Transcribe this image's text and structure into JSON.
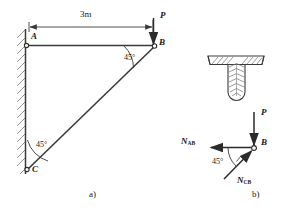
{
  "figure": {
    "caption_a": "a)",
    "caption_b": "b)",
    "top_faint_text": "",
    "diagram_a": {
      "dimension_label": "3m",
      "point_a_label": "A",
      "point_b_label": "B",
      "point_c_label": "C",
      "load_label": "P",
      "angle_top_label": "45°",
      "angle_bottom_label": "45°",
      "support": "fixed-wall-hatched"
    },
    "diagram_b": {
      "section_detail": "tee-section-hatched",
      "joint_label": "B",
      "load_label": "P",
      "force_ab_label": "N",
      "force_ab_sub": "AB",
      "force_cb_label": "N",
      "force_cb_sub": "CB",
      "angle_label": "45°"
    },
    "colors": {
      "line": "#3a3a3a",
      "hatch": "#6f6f6f",
      "text": "#1a1a1a",
      "background": "#ffffff"
    }
  }
}
